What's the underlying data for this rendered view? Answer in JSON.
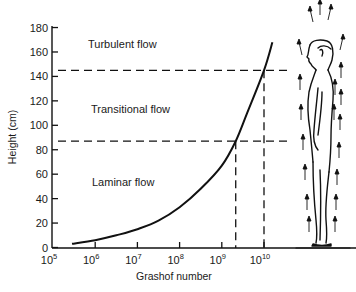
{
  "chart_data": {
    "type": "line",
    "title": "",
    "xlabel": "Grashof number",
    "ylabel": "Height (cm)",
    "x_scale": "log",
    "xlim": [
      100000,
      25000000000
    ],
    "ylim": [
      0,
      180
    ],
    "x_ticks": [
      {
        "base": "10",
        "exp": "5"
      },
      {
        "base": "10",
        "exp": "6"
      },
      {
        "base": "10",
        "exp": "7"
      },
      {
        "base": "10",
        "exp": "8"
      },
      {
        "base": "10",
        "exp": "9"
      },
      {
        "base": "10",
        "exp": "10"
      }
    ],
    "y_ticks": [
      "0",
      "20",
      "40",
      "60",
      "80",
      "100",
      "120",
      "140",
      "160",
      "180"
    ],
    "grid": false,
    "series": [
      {
        "name": "Height vs Grashof number",
        "log10_x": [
          5.45,
          6.0,
          6.5,
          7.0,
          7.5,
          8.0,
          8.5,
          9.0,
          9.33,
          9.6,
          10.0,
          10.2
        ],
        "y": [
          3,
          6,
          10,
          15,
          22,
          33,
          48,
          67,
          87,
          110,
          145,
          168
        ]
      }
    ],
    "reference_lines": {
      "horizontal": [
        {
          "y": 145,
          "meaning": "transition to turbulent flow"
        },
        {
          "y": 87,
          "meaning": "transition from laminar flow"
        }
      ],
      "vertical": [
        {
          "log10_x": 9.33,
          "meaning": "Grashof ≈ 2×10^9 (laminar limit)"
        },
        {
          "log10_x": 10.0,
          "meaning": "Grashof 10^10 (turbulent onset)"
        }
      ]
    },
    "annotations": [
      "Turbulent flow",
      "Transitional flow",
      "Laminar flow"
    ],
    "illustration": "Standing human figure in profile with upward airflow arrows around the body"
  },
  "labels": {
    "turbulent": "Turbulent flow",
    "transitional": "Transitional flow",
    "laminar": "Laminar flow",
    "xlabel": "Grashof number",
    "ylabel": "Height (cm)"
  }
}
